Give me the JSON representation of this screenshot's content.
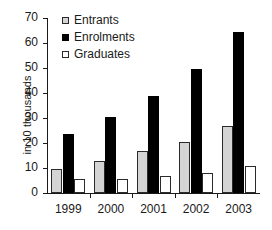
{
  "chart_data": {
    "type": "bar",
    "title": "",
    "xlabel": "",
    "ylabel": "in 10 thousands",
    "categories": [
      "1999",
      "2000",
      "2001",
      "2002",
      "2003"
    ],
    "series": [
      {
        "name": "Entrants",
        "color": "#d4d4d4",
        "values": [
          9.7,
          13.0,
          16.7,
          20.3,
          26.8
        ]
      },
      {
        "name": "Enrolments",
        "color": "#000000",
        "values": [
          23.8,
          30.3,
          39.0,
          49.8,
          64.3
        ]
      },
      {
        "name": "Graduates",
        "color": "#ffffff",
        "values": [
          5.7,
          5.8,
          6.7,
          8.1,
          11.0
        ]
      }
    ],
    "ylim": [
      0,
      70
    ],
    "yticks": [
      0,
      10,
      20,
      30,
      40,
      50,
      60,
      70
    ],
    "ytick_labels": [
      "0",
      "10",
      "20",
      "30",
      "40",
      "50",
      "60",
      "70"
    ],
    "grid": false,
    "legend_position": "top-left"
  }
}
